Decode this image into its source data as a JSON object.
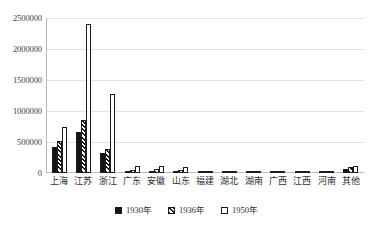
{
  "chart_data": {
    "type": "bar",
    "title": "",
    "subtitle": "",
    "xlabel": "",
    "ylabel": "",
    "ylim": [
      0,
      2500000
    ],
    "yticks": [
      0,
      500000,
      1000000,
      1500000,
      2000000,
      2500000
    ],
    "ytick_labels": [
      "0",
      "500000",
      "1000000",
      "1500000",
      "2000000",
      "2500000"
    ],
    "grid": true,
    "legend_position": "bottom",
    "categories": [
      "上海",
      "江苏",
      "浙江",
      "广东",
      "安徽",
      "山东",
      "福建",
      "湖北",
      "湖南",
      "广西",
      "江西",
      "河南",
      "其他"
    ],
    "series": [
      {
        "name": "1930年",
        "fill": "solid-black",
        "values": [
          420000,
          660000,
          330000,
          30000,
          36000,
          20000,
          12000,
          30000,
          12000,
          8000,
          8000,
          10000,
          60000
        ]
      },
      {
        "name": "1936年",
        "fill": "diagonal-hatch",
        "values": [
          520000,
          860000,
          390000,
          52000,
          72000,
          48000,
          18000,
          34000,
          16000,
          10000,
          10000,
          14000,
          90000
        ]
      },
      {
        "name": "1950年",
        "fill": "white",
        "values": [
          750000,
          2400000,
          1280000,
          110000,
          108000,
          92000,
          24000,
          40000,
          20000,
          12000,
          14000,
          18000,
          120000
        ]
      }
    ]
  },
  "legend": {
    "items": [
      {
        "label": "1930年"
      },
      {
        "label": "1936年"
      },
      {
        "label": "1950年"
      }
    ]
  }
}
